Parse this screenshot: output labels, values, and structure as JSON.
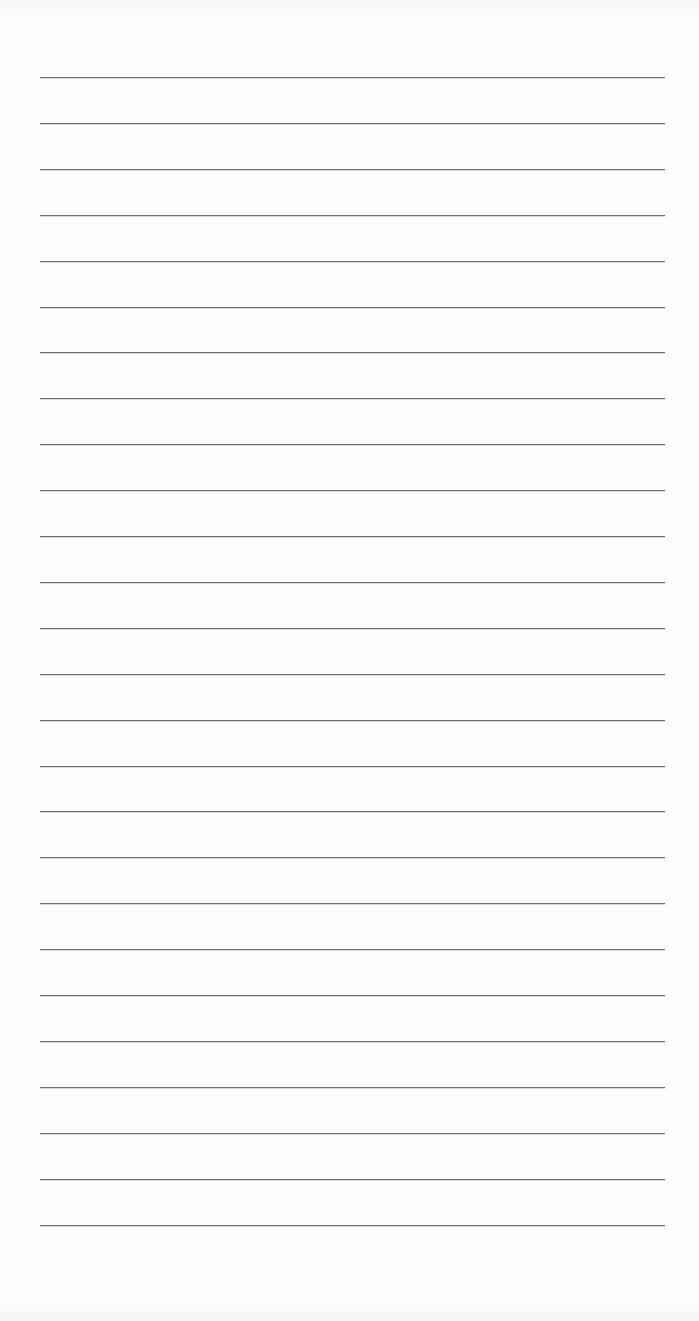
{
  "document": {
    "type": "lined-paper",
    "rule_count": 26,
    "first_rule_y": 77,
    "rule_spacing": 45.9,
    "rule_left": 40,
    "rule_width": 625,
    "rule_color": "#6e6e6e",
    "paper_color": "#fdfdfd",
    "text_lines": []
  }
}
